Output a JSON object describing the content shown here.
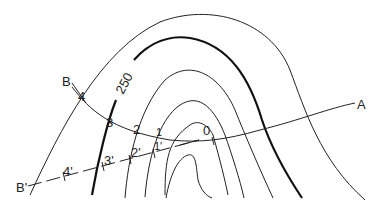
{
  "diagram": {
    "contour_label": "250",
    "section_line": {
      "start_label": "A",
      "end_label": "B",
      "points": [
        "0",
        "1",
        "2",
        "3",
        "4"
      ]
    },
    "projected_line": {
      "end_label": "B'",
      "points": [
        "1'",
        "2'",
        "3'",
        "4'"
      ]
    },
    "colors": {
      "line": "#222222",
      "background": "#ffffff"
    }
  }
}
